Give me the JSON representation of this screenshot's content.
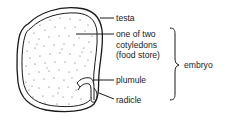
{
  "diagram": {
    "labels": {
      "testa": "testa",
      "cotyledon_line1": "one of two",
      "cotyledon_line2": "cotyledons",
      "cotyledon_line3": "(food store)",
      "plumule": "plumule",
      "radicle": "radicle",
      "embryo": "embryo"
    },
    "colors": {
      "stroke": "#1a1a1a",
      "stipple": "#555555",
      "background": "#ffffff"
    },
    "parts": [
      "seed-coat-testa",
      "cotyledon",
      "plumule",
      "radicle",
      "embryo-bracket"
    ]
  }
}
